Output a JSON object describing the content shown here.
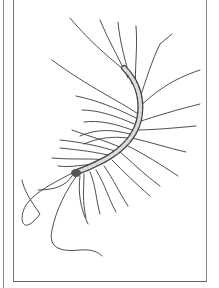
{
  "illustration": {
    "subject": "centipede",
    "style": "black ink line drawing",
    "colors": {
      "ink": "#333333",
      "background": "#ffffff",
      "border": "#777777"
    }
  }
}
